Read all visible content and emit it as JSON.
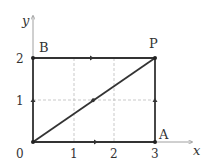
{
  "axes": {
    "x_label": "x",
    "y_label": "y",
    "x_ticks": [
      "0",
      "1",
      "2",
      "3"
    ],
    "y_ticks": [
      "1",
      "2"
    ]
  },
  "points": {
    "origin": {
      "label": "0",
      "x": 0,
      "y": 0
    },
    "A": {
      "label": "A",
      "x": 3,
      "y": 0
    },
    "B": {
      "label": "B",
      "x": 0,
      "y": 2
    },
    "P": {
      "label": "P",
      "x": 3,
      "y": 2
    }
  },
  "paths": [
    {
      "name": "O-to-A-to-P",
      "from": "O",
      "via": "A",
      "to": "P"
    },
    {
      "name": "O-to-B-to-P",
      "from": "O",
      "via": "B",
      "to": "P"
    },
    {
      "name": "O-to-P-diagonal",
      "from": "O",
      "to": "P"
    }
  ],
  "colors": {
    "path": "#333333",
    "axis": "#888888",
    "grid": "#bbbbbb"
  }
}
